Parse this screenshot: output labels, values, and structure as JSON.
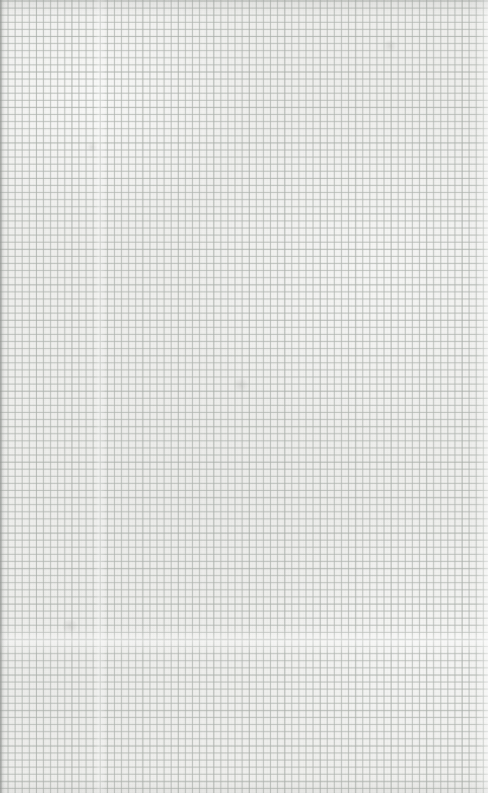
{
  "document": {
    "kind": "graph-paper-scan",
    "description": "Blank square-ruled graph paper sheet, scanned",
    "width_px": 488,
    "height_px": 793,
    "annotations": [],
    "text_content": "",
    "blank_note": ""
  },
  "paper": {
    "base_color": "#efefed",
    "tone_light": "#f3f3f1",
    "tone_dark": "#e7e7e5"
  },
  "grid": {
    "line_color": "#b0b5b0",
    "accent_line_color": "#a0a6a0",
    "cell_size_px": 7.1,
    "accent_every_n_cells": 5,
    "orientation": "square",
    "has_margin_rule": false,
    "has_numbers": false
  },
  "artifacts": {
    "left_edge_shadow": "#787a78",
    "right_edge_highlight": "#ffffff",
    "vertical_seam_x_px": 100,
    "horizontal_seam_y_px": 640,
    "smudge_color": "#969694"
  }
}
